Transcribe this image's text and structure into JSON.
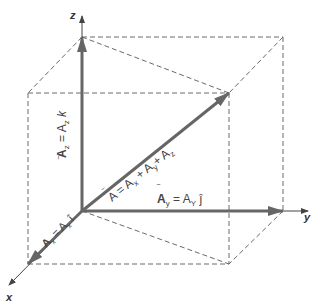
{
  "diagram": {
    "axes": {
      "x_label": "x",
      "y_label": "y",
      "z_label": "z"
    },
    "vectors": {
      "resultant": {
        "label": "A⃗ = A⃗x + A⃗y + A⃗z",
        "text_main": "A",
        "text_eq": " = ",
        "text_ax": "A",
        "sub_x": "x",
        "text_plus1": " + ",
        "text_ay": "A",
        "sub_y": "y",
        "text_plus2": "+ ",
        "text_az": "A",
        "sub_z": "z"
      },
      "x_component": {
        "text_a": "A",
        "sub": "x",
        "eq": " = A",
        "sub2": "x",
        "unit": " î"
      },
      "y_component": {
        "text_a": "A",
        "sub": "y",
        "eq": " = A",
        "sub2": "Y",
        "unit": " ĵ"
      },
      "z_component": {
        "text_a": "A",
        "sub": "z",
        "eq": " = A",
        "sub2": "z",
        "unit": " k"
      }
    },
    "colors": {
      "vector": "#666666",
      "axis": "#444444",
      "dashed": "#6a6a6a"
    }
  }
}
